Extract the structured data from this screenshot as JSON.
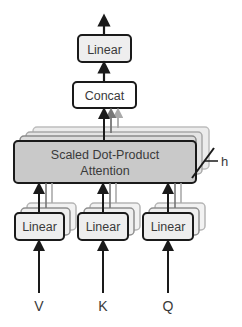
{
  "diagram": {
    "output_linear": {
      "label": "Linear"
    },
    "concat": {
      "label": "Concat"
    },
    "attention": {
      "line1": "Scaled Dot-Product",
      "line2": "Attention"
    },
    "heads_label": "h",
    "input_linears": [
      {
        "label": "Linear",
        "input": "V"
      },
      {
        "label": "Linear",
        "input": "K"
      },
      {
        "label": "Linear",
        "input": "Q"
      }
    ],
    "colors": {
      "box_stroke": "#1a1a1a",
      "linear_fill": "#eeeeee",
      "concat_fill": "#ffffff",
      "attention_fill": "#c9c9c9",
      "shadow_layer_fill": "#e4e4e4",
      "shadow_layer_stroke": "#9a9a9a",
      "text": "#3a3a3a"
    }
  }
}
